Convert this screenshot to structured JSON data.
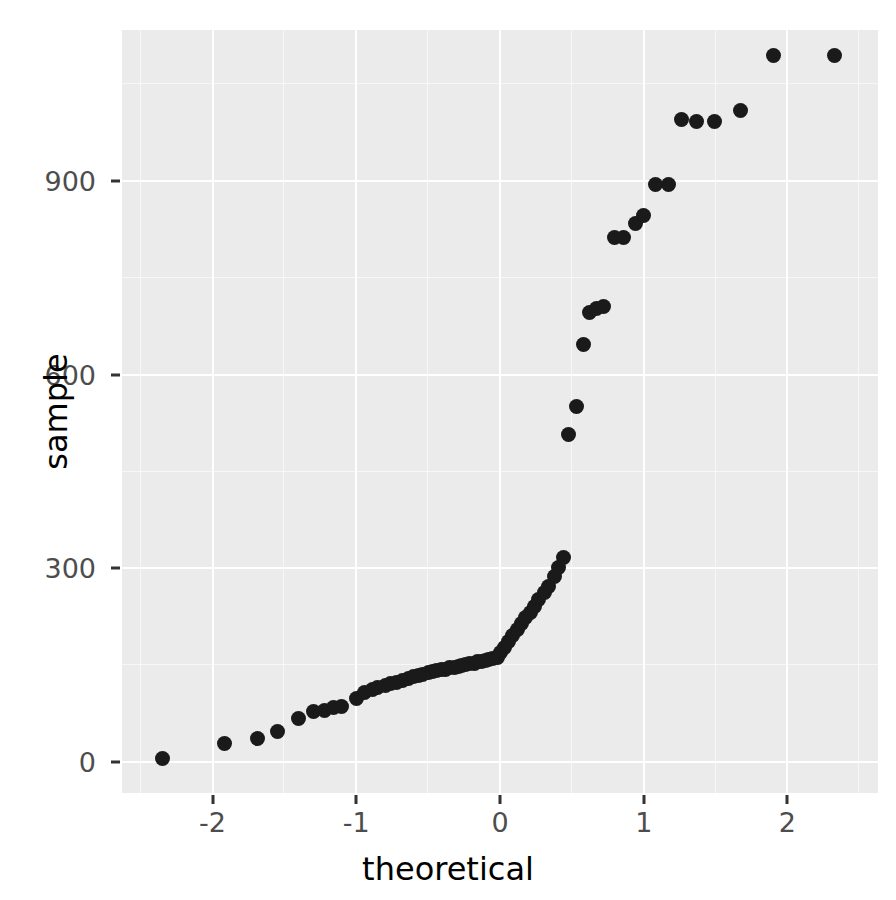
{
  "chart_data": {
    "type": "scatter",
    "title": "",
    "subtitle": "",
    "xlabel": "theoretical",
    "ylabel": "sample",
    "xlim": [
      -2.63,
      2.63
    ],
    "ylim": [
      -48,
      1134
    ],
    "grid": true,
    "legend": null,
    "legend_position": "none",
    "panel_background": "#ebebeb",
    "grid_color": "#ffffff",
    "point_color": "#1a1a1a",
    "point_size": 15,
    "x_ticks": [
      {
        "value": -2,
        "label": "-2"
      },
      {
        "value": -1,
        "label": "-1"
      },
      {
        "value": 0,
        "label": "0"
      },
      {
        "value": 1,
        "label": "1"
      },
      {
        "value": 2,
        "label": "2"
      }
    ],
    "y_ticks": [
      {
        "value": 0,
        "label": "0"
      },
      {
        "value": 300,
        "label": "300"
      },
      {
        "value": 600,
        "label": "600"
      },
      {
        "value": 900,
        "label": "900"
      }
    ],
    "x_minor_ticks": [
      -2.5,
      -1.5,
      -0.5,
      0.5,
      1.5,
      2.5
    ],
    "y_minor_ticks": [
      150,
      450,
      750,
      1050
    ],
    "x": [
      -2.35,
      -1.92,
      -1.69,
      -1.55,
      -1.4,
      -1.3,
      -1.22,
      -1.16,
      -1.1,
      -1.0,
      -0.94,
      -0.89,
      -0.85,
      -0.8,
      -0.76,
      -0.72,
      -0.68,
      -0.64,
      -0.6,
      -0.57,
      -0.54,
      -0.5,
      -0.47,
      -0.44,
      -0.41,
      -0.38,
      -0.35,
      -0.32,
      -0.29,
      -0.27,
      -0.24,
      -0.21,
      -0.18,
      -0.16,
      -0.13,
      -0.1,
      -0.08,
      -0.05,
      -0.02,
      0.0,
      0.03,
      0.06,
      0.09,
      0.12,
      0.15,
      0.18,
      0.21,
      0.24,
      0.27,
      0.31,
      0.34,
      0.38,
      0.41,
      0.44,
      0.48,
      0.53,
      0.58,
      0.62,
      0.67,
      0.72,
      0.8,
      0.86,
      0.94,
      1.0,
      1.08,
      1.17,
      1.26,
      1.37,
      1.49,
      1.67,
      1.9,
      2.33
    ],
    "y": [
      5,
      29,
      36,
      48,
      68,
      78,
      80,
      85,
      86,
      98,
      107,
      112,
      115,
      118,
      121,
      123,
      127,
      130,
      132,
      134,
      136,
      138,
      140,
      141,
      143,
      144,
      146,
      147,
      148,
      149,
      151,
      152,
      153,
      155,
      156,
      157,
      159,
      160,
      162,
      170,
      178,
      186,
      196,
      206,
      215,
      224,
      232,
      241,
      252,
      262,
      272,
      288,
      302,
      317,
      508,
      551,
      647,
      697,
      702,
      705,
      812,
      812,
      835,
      847,
      894,
      894,
      995,
      993,
      993,
      1009,
      1095,
      1095
    ]
  },
  "axis": {
    "y_title": "sample",
    "x_title": "theoretical"
  }
}
